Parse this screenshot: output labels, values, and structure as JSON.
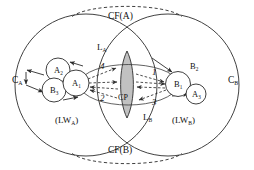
{
  "diagram": {
    "canvas": {
      "width": 254,
      "height": 170,
      "background": "#ffffff"
    },
    "colors": {
      "stroke": "#2b2b2b",
      "lens_fill": "#b8b8b8",
      "text": "#111111",
      "background": "#ffffff"
    },
    "big_circles": [
      {
        "id": "C_A",
        "label_main": "C",
        "label_sub": "A",
        "cx": 86,
        "cy": 85,
        "r": 71
      },
      {
        "id": "C_B",
        "label_main": "C",
        "label_sub": "B",
        "cx": 168,
        "cy": 85,
        "r": 71
      }
    ],
    "region_labels": {
      "c_a_main": "C",
      "c_a_sub": "A",
      "c_b_main": "C",
      "c_b_sub": "B",
      "cf_a": "CF(A)",
      "cf_b": "CF(B)",
      "lw_a_prefix": "(LW",
      "lw_a_sub": "A",
      "lw_a_suffix": ")",
      "lw_b_prefix": "(LW",
      "lw_b_sub": "B",
      "lw_b_suffix": ")",
      "cp": "CP",
      "l_a_main": "L",
      "l_a_sub": "A",
      "l_b_main": "L",
      "l_b_sub": "B"
    },
    "nodes": [
      {
        "id": "A2",
        "main": "A",
        "sub": "2",
        "cx": 58,
        "cy": 70,
        "r": 12,
        "side": "left"
      },
      {
        "id": "B3",
        "main": "B",
        "sub": "3",
        "cx": 54,
        "cy": 90,
        "r": 12,
        "side": "left"
      },
      {
        "id": "A1",
        "main": "A",
        "sub": "1",
        "cx": 76,
        "cy": 83,
        "r": 13,
        "side": "left"
      },
      {
        "id": "B1",
        "main": "B",
        "sub": "1",
        "cx": 178,
        "cy": 84,
        "r": 12.5,
        "side": "right"
      },
      {
        "id": "A3",
        "main": "A",
        "sub": "3",
        "cx": 196,
        "cy": 94,
        "r": 10,
        "side": "right"
      },
      {
        "id": "B2",
        "main": "B",
        "sub": "2",
        "cx": 196,
        "cy": 70,
        "r": 0,
        "side": "right",
        "label_only": true
      }
    ],
    "flow_labels": [
      {
        "id": "flow-4",
        "text": "4",
        "x": 100,
        "y": 66
      },
      {
        "id": "flow-2",
        "text": "2",
        "x": 100,
        "y": 96
      },
      {
        "id": "flow-1",
        "text": "1",
        "x": 151,
        "y": 72
      },
      {
        "id": "flow-3",
        "text": "3",
        "x": 151,
        "y": 98
      }
    ],
    "lens": {
      "label": "CP",
      "top_x": 127,
      "top_y": 51,
      "bottom_x": 127,
      "bottom_y": 118,
      "half_width": 9
    }
  }
}
